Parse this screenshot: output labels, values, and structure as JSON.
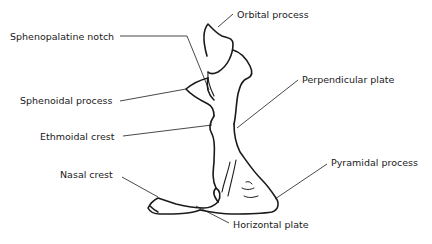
{
  "diagram": {
    "stroke_color": "#1a1a1a",
    "labels": [
      {
        "id": "orbital_process",
        "text": "Orbital process"
      },
      {
        "id": "sphenopalatine_notch",
        "text": "Sphenopalatine notch"
      },
      {
        "id": "sphenoidal_process",
        "text": "Sphenoidal process"
      },
      {
        "id": "perpendicular_plate",
        "text": "Perpendicular plate"
      },
      {
        "id": "ethmoidal_crest",
        "text": "Ethmoidal crest"
      },
      {
        "id": "nasal_crest",
        "text": "Nasal crest"
      },
      {
        "id": "pyramidal_process",
        "text": "Pyramidal process"
      },
      {
        "id": "horizontal_plate",
        "text": "Horizontal plate"
      }
    ]
  }
}
